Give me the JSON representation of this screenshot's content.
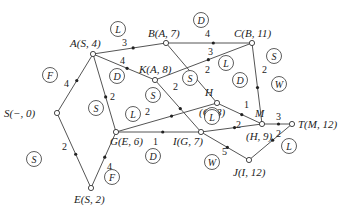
{
  "diagram": {
    "type": "shortest-path network",
    "nodes": [
      {
        "id": "S",
        "label": "S(−, 0)",
        "x": 57,
        "y": 113,
        "lx": 4,
        "ly": 117
      },
      {
        "id": "A",
        "label": "A(S, 4)",
        "x": 93,
        "y": 54,
        "lx": 70,
        "ly": 47
      },
      {
        "id": "B",
        "label": "B(A, 7)",
        "x": 166,
        "y": 43,
        "lx": 148,
        "ly": 37
      },
      {
        "id": "C",
        "label": "C(B, 11)",
        "x": 252,
        "y": 43,
        "lx": 234,
        "ly": 37
      },
      {
        "id": "K",
        "label": "K(A, 8)",
        "x": 155,
        "y": 80,
        "lx": 139,
        "ly": 73
      },
      {
        "id": "H",
        "label": "H",
        "x": 217,
        "y": 103,
        "lx": 205,
        "ly": 96
      },
      {
        "id": "H2",
        "label": "(G, 8)",
        "x": 217,
        "y": 103,
        "lx": 199,
        "ly": 116
      },
      {
        "id": "M",
        "label": "M",
        "x": 262,
        "y": 124,
        "lx": 255,
        "ly": 117
      },
      {
        "id": "M2",
        "label": "(H, 9)",
        "x": 262,
        "y": 124,
        "lx": 246,
        "ly": 140
      },
      {
        "id": "T",
        "label": "T(M, 12)",
        "x": 292,
        "y": 124,
        "lx": 298,
        "ly": 128
      },
      {
        "id": "G",
        "label": "G(E, 6)",
        "x": 116,
        "y": 132,
        "lx": 110,
        "ly": 145
      },
      {
        "id": "I",
        "label": "I(G, 7)",
        "x": 201,
        "y": 132,
        "lx": 173,
        "ly": 145
      },
      {
        "id": "J",
        "label": "J(I, 12)",
        "x": 249,
        "y": 160,
        "lx": 233,
        "ly": 176
      },
      {
        "id": "E",
        "label": "E(S, 2)",
        "x": 91,
        "y": 188,
        "lx": 74,
        "ly": 203
      }
    ],
    "edges": [
      {
        "from": "S",
        "to": "A",
        "weight": "4",
        "wx": 64,
        "wy": 87
      },
      {
        "from": "S",
        "to": "E",
        "weight": "2",
        "wx": 62,
        "wy": 150
      },
      {
        "from": "A",
        "to": "B",
        "weight": "3",
        "wx": 122,
        "wy": 46
      },
      {
        "from": "A",
        "to": "K",
        "weight": "4",
        "wx": 120,
        "wy": 64
      },
      {
        "from": "A",
        "to": "G",
        "weight": "2",
        "wx": 110,
        "wy": 100
      },
      {
        "from": "B",
        "to": "C",
        "weight": "4",
        "wx": 205,
        "wy": 37
      },
      {
        "from": "B",
        "to": "H",
        "weight": "2",
        "wx": 205,
        "wy": 73
      },
      {
        "from": "K",
        "to": "C",
        "weight": "3",
        "wx": 208,
        "wy": 55
      },
      {
        "from": "K",
        "to": "I",
        "weight": "2",
        "wx": 173,
        "wy": 90
      },
      {
        "from": "G",
        "to": "H",
        "weight": "2",
        "wx": 145,
        "wy": 115
      },
      {
        "from": "G",
        "to": "I",
        "weight": "1",
        "wx": 153,
        "wy": 145
      },
      {
        "from": "E",
        "to": "G",
        "weight": "4",
        "wx": 107,
        "wy": 170
      },
      {
        "from": "H",
        "to": "M",
        "weight": "1",
        "wx": 244,
        "wy": 108
      },
      {
        "from": "C",
        "to": "M",
        "weight": "2",
        "wx": 262,
        "wy": 73
      },
      {
        "from": "I",
        "to": "M",
        "weight": "2",
        "wx": 236,
        "wy": 128
      },
      {
        "from": "I",
        "to": "J",
        "weight": "5",
        "wx": 222,
        "wy": 155
      },
      {
        "from": "M",
        "to": "T",
        "weight": "3",
        "wx": 276,
        "wy": 120
      },
      {
        "from": "J",
        "to": "T",
        "weight": "2",
        "wx": 276,
        "wy": 137
      }
    ],
    "region_labels": [
      {
        "text": "L",
        "x": 118,
        "y": 29
      },
      {
        "text": "D",
        "x": 201,
        "y": 20
      },
      {
        "text": "F",
        "x": 50,
        "y": 75
      },
      {
        "text": "D",
        "x": 117,
        "y": 76
      },
      {
        "text": "S",
        "x": 274,
        "y": 56
      },
      {
        "text": "L",
        "x": 226,
        "y": 63
      },
      {
        "text": "S",
        "x": 190,
        "y": 78
      },
      {
        "text": "D",
        "x": 240,
        "y": 80
      },
      {
        "text": "W",
        "x": 279,
        "y": 84
      },
      {
        "text": "S",
        "x": 96,
        "y": 108
      },
      {
        "text": "S",
        "x": 153,
        "y": 95
      },
      {
        "text": "L",
        "x": 133,
        "y": 114
      },
      {
        "text": "L",
        "x": 212,
        "y": 115
      },
      {
        "text": "L",
        "x": 212,
        "y": 117
      },
      {
        "text": "S",
        "x": 34,
        "y": 159
      },
      {
        "text": "D",
        "x": 153,
        "y": 156
      },
      {
        "text": "F",
        "x": 112,
        "y": 177
      },
      {
        "text": "W",
        "x": 212,
        "y": 162
      },
      {
        "text": "L",
        "x": 289,
        "y": 146
      }
    ]
  }
}
